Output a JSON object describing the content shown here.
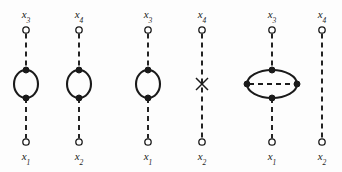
{
  "figure": {
    "background_color": "#fdfdfd",
    "line_color": "#1a1a1a",
    "node_fill_open": "#ffffff",
    "node_fill_closed": "#1a1a1a",
    "canvas": {
      "width": 342,
      "height": 172
    },
    "dash_pattern": "5 4",
    "diagrams": [
      {
        "id": "diagram-1",
        "index": 1,
        "center_x": 26,
        "insertion": "loop",
        "loop_radius_x": 12,
        "loop_radius_y": 14,
        "loop_center_y": 84,
        "top_label": "x",
        "top_sub": "3",
        "bottom_label": "x",
        "bottom_sub": "1",
        "top_node_y": 30,
        "bottom_node_y": 142,
        "top_vertex_y": 70,
        "bottom_vertex_y": 98,
        "internal_dashed_line": false
      },
      {
        "id": "diagram-2",
        "index": 2,
        "center_x": 79,
        "insertion": "loop",
        "loop_radius_x": 12,
        "loop_radius_y": 14,
        "loop_center_y": 84,
        "top_label": "x",
        "top_sub": "4",
        "bottom_label": "x",
        "bottom_sub": "2",
        "top_node_y": 30,
        "bottom_node_y": 142,
        "top_vertex_y": 70,
        "bottom_vertex_y": 98,
        "internal_dashed_line": false
      },
      {
        "id": "diagram-3",
        "index": 3,
        "center_x": 148,
        "insertion": "loop",
        "loop_radius_x": 12,
        "loop_radius_y": 14,
        "loop_center_y": 84,
        "top_label": "x",
        "top_sub": "3",
        "bottom_label": "x",
        "bottom_sub": "1",
        "top_node_y": 30,
        "bottom_node_y": 142,
        "top_vertex_y": 70,
        "bottom_vertex_y": 98,
        "internal_dashed_line": false
      },
      {
        "id": "diagram-4",
        "index": 4,
        "center_x": 202,
        "insertion": "cross",
        "cross_size": 6,
        "cross_center_y": 84,
        "top_label": "x",
        "top_sub": "4",
        "bottom_label": "x",
        "bottom_sub": "2",
        "top_node_y": 30,
        "bottom_node_y": 142,
        "internal_dashed_line": false
      },
      {
        "id": "diagram-5",
        "index": 5,
        "center_x": 272,
        "insertion": "ellipse",
        "loop_radius_x": 25,
        "loop_radius_y": 14,
        "loop_center_y": 84,
        "top_label": "x",
        "top_sub": "3",
        "bottom_label": "x",
        "bottom_sub": "1",
        "top_node_y": 30,
        "bottom_node_y": 142,
        "top_vertex_y": 70,
        "bottom_vertex_y": 98,
        "internal_dashed_line": true
      },
      {
        "id": "diagram-6",
        "index": 6,
        "center_x": 322,
        "insertion": "none",
        "top_label": "x",
        "top_sub": "4",
        "bottom_label": "x",
        "bottom_sub": "2",
        "top_node_y": 30,
        "bottom_node_y": 142,
        "internal_dashed_line": false
      }
    ],
    "labels": {
      "top_row": [
        {
          "text": "x",
          "sub": "3",
          "x": 26,
          "y": 8
        },
        {
          "text": "x",
          "sub": "4",
          "x": 79,
          "y": 8
        },
        {
          "text": "x",
          "sub": "3",
          "x": 148,
          "y": 8
        },
        {
          "text": "x",
          "sub": "4",
          "x": 202,
          "y": 8
        },
        {
          "text": "x",
          "sub": "3",
          "x": 272,
          "y": 8
        },
        {
          "text": "x",
          "sub": "4",
          "x": 322,
          "y": 8
        }
      ],
      "bottom_row": [
        {
          "text": "x",
          "sub": "1",
          "x": 26,
          "y": 150
        },
        {
          "text": "x",
          "sub": "2",
          "x": 79,
          "y": 150
        },
        {
          "text": "x",
          "sub": "1",
          "x": 148,
          "y": 150
        },
        {
          "text": "x",
          "sub": "2",
          "x": 202,
          "y": 150
        },
        {
          "text": "x",
          "sub": "1",
          "x": 272,
          "y": 150
        },
        {
          "text": "x",
          "sub": "2",
          "x": 322,
          "y": 150
        }
      ]
    }
  }
}
